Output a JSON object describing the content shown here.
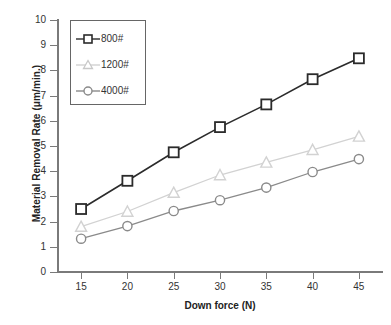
{
  "chart_data": {
    "type": "line",
    "title": "",
    "xlabel": "Down force (N)",
    "ylabel": "Material Removal Rate  (μm/min.)",
    "x": [
      15,
      20,
      25,
      30,
      35,
      40,
      45
    ],
    "xlim": [
      12.5,
      47.5
    ],
    "ylim": [
      0,
      10
    ],
    "xticks": [
      "15",
      "20",
      "25",
      "30",
      "35",
      "40",
      "45"
    ],
    "yticks": [
      "0",
      "1",
      "2",
      "3",
      "4",
      "5",
      "6",
      "7",
      "8",
      "9",
      "10"
    ],
    "grid": false,
    "legend_position": "upper-left",
    "series": [
      {
        "name": "800#",
        "color": "#2b2b2b",
        "marker": "square",
        "values": [
          2.5,
          3.62,
          4.75,
          5.75,
          6.65,
          7.65,
          8.48
        ]
      },
      {
        "name": "1200#",
        "color": "#d2d2d2",
        "marker": "triangle",
        "values": [
          1.8,
          2.4,
          3.15,
          3.85,
          4.35,
          4.85,
          5.38
        ]
      },
      {
        "name": "4000#",
        "color": "#8a8a8a",
        "marker": "circle",
        "values": [
          1.32,
          1.82,
          2.42,
          2.85,
          3.35,
          3.97,
          4.48
        ]
      }
    ]
  },
  "axes": {
    "x_title": "Down force (N)",
    "y_title": "Material Removal Rate  (μm/min.)"
  },
  "legend": {
    "entries": [
      {
        "label": "800#"
      },
      {
        "label": "1200#"
      },
      {
        "label": "4000#"
      }
    ]
  }
}
